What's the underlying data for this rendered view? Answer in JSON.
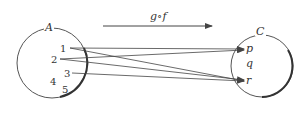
{
  "diagram": {
    "composition_label": "g∘f",
    "set_A": {
      "label": "A",
      "elements": [
        "1",
        "2",
        "3",
        "4",
        "5"
      ]
    },
    "set_C": {
      "label": "C",
      "elements": [
        "p",
        "q",
        "r"
      ]
    },
    "mappings": [
      {
        "from": "1",
        "to": "p"
      },
      {
        "from": "1",
        "to": "r"
      },
      {
        "from": "2",
        "to": "p"
      },
      {
        "from": "2",
        "to": "r"
      },
      {
        "from": "3",
        "to": "r"
      }
    ],
    "colors": {
      "stroke": "#444444",
      "background": "#ffffff"
    }
  }
}
